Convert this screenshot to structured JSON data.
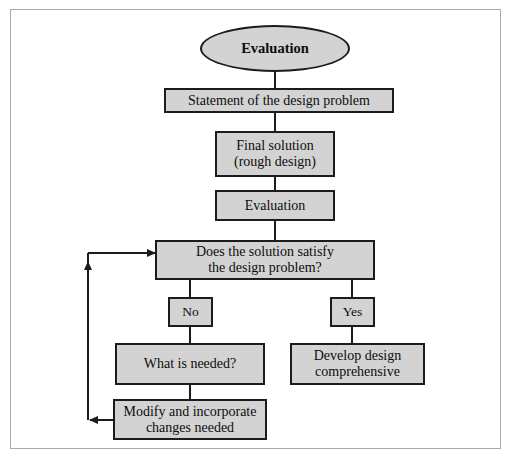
{
  "diagram": {
    "title": "Evaluation",
    "frame": {
      "border_color": "#a9a9a9",
      "background": "#ffffff"
    },
    "node_style": {
      "fill": "#d3d3d3",
      "stroke": "#1c1c1c",
      "text_color": "#0d0d0d"
    },
    "nodes": [
      {
        "id": "start",
        "shape": "ellipse",
        "label": "Evaluation"
      },
      {
        "id": "statement",
        "shape": "rect",
        "label": "Statement of the design problem"
      },
      {
        "id": "final-solution",
        "shape": "rect",
        "label": "Final solution\n(rough design)"
      },
      {
        "id": "evaluation",
        "shape": "rect",
        "label": "Evaluation"
      },
      {
        "id": "decision",
        "shape": "rect",
        "label": "Does the solution satisfy\nthe design problem?"
      },
      {
        "id": "no",
        "shape": "rect",
        "label": "No"
      },
      {
        "id": "yes",
        "shape": "rect",
        "label": "Yes"
      },
      {
        "id": "what-is-needed",
        "shape": "rect",
        "label": "What is needed?"
      },
      {
        "id": "develop-design",
        "shape": "rect",
        "label": "Develop design\ncomprehensive"
      },
      {
        "id": "modify",
        "shape": "rect",
        "label": "Modify and incorporate\nchanges needed"
      }
    ],
    "edges": [
      {
        "from": "start",
        "to": "statement",
        "arrow": false
      },
      {
        "from": "statement",
        "to": "final-solution",
        "arrow": false
      },
      {
        "from": "final-solution",
        "to": "evaluation",
        "arrow": false
      },
      {
        "from": "evaluation",
        "to": "decision",
        "arrow": false
      },
      {
        "from": "decision",
        "to": "no",
        "arrow": false
      },
      {
        "from": "decision",
        "to": "yes",
        "arrow": false
      },
      {
        "from": "no",
        "to": "what-is-needed",
        "arrow": false
      },
      {
        "from": "yes",
        "to": "develop-design",
        "arrow": false
      },
      {
        "from": "what-is-needed",
        "to": "modify",
        "arrow": false
      },
      {
        "from": "modify",
        "to": "feedback-rail",
        "arrow": true
      },
      {
        "from": "feedback-rail",
        "to": "decision",
        "arrow": true
      }
    ]
  }
}
